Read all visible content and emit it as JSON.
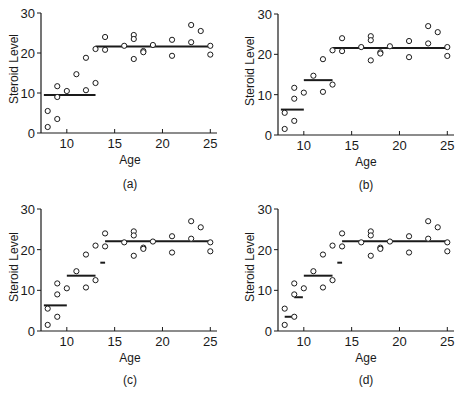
{
  "chart_data": [
    {
      "type": "scatter",
      "panel_label": "(a)",
      "xlabel": "Age",
      "ylabel": "Steroid Level",
      "xlim": [
        7.3,
        25.7
      ],
      "ylim": [
        0,
        30
      ],
      "xticks": [
        10,
        15,
        20,
        25
      ],
      "yticks": [
        0,
        10,
        20,
        30
      ],
      "grid": false,
      "points": [
        [
          8,
          1.5
        ],
        [
          8,
          5.5
        ],
        [
          9,
          3.5
        ],
        [
          9,
          9
        ],
        [
          9,
          11.7
        ],
        [
          10,
          10.5
        ],
        [
          11,
          14.7
        ],
        [
          12,
          10.7
        ],
        [
          12,
          18.8
        ],
        [
          13,
          12.5
        ],
        [
          13,
          21
        ],
        [
          14,
          24
        ],
        [
          14,
          20.8
        ],
        [
          16,
          21.8
        ],
        [
          17,
          24.5
        ],
        [
          17,
          23.5
        ],
        [
          17,
          18.5
        ],
        [
          18,
          20.5
        ],
        [
          18,
          20.2
        ],
        [
          19,
          22
        ],
        [
          21,
          23.3
        ],
        [
          21,
          19.3
        ],
        [
          23,
          27
        ],
        [
          23,
          22.7
        ],
        [
          24,
          25.5
        ],
        [
          25,
          21.8
        ],
        [
          25,
          19.6
        ]
      ],
      "step_fit": [
        {
          "x0": 7.6,
          "x1": 13,
          "y": 9.5
        },
        {
          "x0": 13,
          "x1": 25,
          "y": 21.6
        }
      ]
    },
    {
      "type": "scatter",
      "panel_label": "(b)",
      "xlabel": "Age",
      "ylabel": "Steroid Level",
      "xlim": [
        7.3,
        25.7
      ],
      "ylim": [
        0,
        30
      ],
      "xticks": [
        10,
        15,
        20,
        25
      ],
      "yticks": [
        0,
        10,
        20,
        30
      ],
      "grid": false,
      "points": [
        [
          8,
          1.5
        ],
        [
          8,
          5.5
        ],
        [
          9,
          3.5
        ],
        [
          9,
          9
        ],
        [
          9,
          11.7
        ],
        [
          10,
          10.5
        ],
        [
          11,
          14.7
        ],
        [
          12,
          10.7
        ],
        [
          12,
          18.8
        ],
        [
          13,
          12.5
        ],
        [
          13,
          21
        ],
        [
          14,
          24
        ],
        [
          14,
          20.8
        ],
        [
          16,
          21.8
        ],
        [
          17,
          24.5
        ],
        [
          17,
          23.5
        ],
        [
          17,
          18.5
        ],
        [
          18,
          20.5
        ],
        [
          18,
          20.2
        ],
        [
          19,
          22
        ],
        [
          21,
          23.3
        ],
        [
          21,
          19.3
        ],
        [
          23,
          27
        ],
        [
          23,
          22.7
        ],
        [
          24,
          25.5
        ],
        [
          25,
          21.8
        ],
        [
          25,
          19.6
        ]
      ],
      "step_fit": [
        {
          "x0": 7.6,
          "x1": 10,
          "y": 6.3
        },
        {
          "x0": 10,
          "x1": 13,
          "y": 13.6
        },
        {
          "x0": 13,
          "x1": 25,
          "y": 21.6
        }
      ]
    },
    {
      "type": "scatter",
      "panel_label": "(c)",
      "xlabel": "Age",
      "ylabel": "Steroid Level",
      "xlim": [
        7.3,
        25.7
      ],
      "ylim": [
        0,
        30
      ],
      "xticks": [
        10,
        15,
        20,
        25
      ],
      "yticks": [
        0,
        10,
        20,
        30
      ],
      "grid": false,
      "points": [
        [
          8,
          1.5
        ],
        [
          8,
          5.5
        ],
        [
          9,
          3.5
        ],
        [
          9,
          9
        ],
        [
          9,
          11.7
        ],
        [
          10,
          10.5
        ],
        [
          11,
          14.7
        ],
        [
          12,
          10.7
        ],
        [
          12,
          18.8
        ],
        [
          13,
          12.5
        ],
        [
          13,
          21
        ],
        [
          14,
          24
        ],
        [
          14,
          20.8
        ],
        [
          16,
          21.8
        ],
        [
          17,
          24.5
        ],
        [
          17,
          23.5
        ],
        [
          17,
          18.5
        ],
        [
          18,
          20.5
        ],
        [
          18,
          20.2
        ],
        [
          19,
          22
        ],
        [
          21,
          23.3
        ],
        [
          21,
          19.3
        ],
        [
          23,
          27
        ],
        [
          23,
          22.7
        ],
        [
          24,
          25.5
        ],
        [
          25,
          21.8
        ],
        [
          25,
          19.6
        ]
      ],
      "step_fit": [
        {
          "x0": 7.6,
          "x1": 10,
          "y": 6.3
        },
        {
          "x0": 10,
          "x1": 13,
          "y": 13.6
        },
        {
          "x0": 13.5,
          "x1": 14,
          "y": 16.8
        },
        {
          "x0": 14,
          "x1": 25,
          "y": 22.1
        }
      ]
    },
    {
      "type": "scatter",
      "panel_label": "(d)",
      "xlabel": "Age",
      "ylabel": "Steroid Level",
      "xlim": [
        7.3,
        25.7
      ],
      "ylim": [
        0,
        30
      ],
      "xticks": [
        10,
        15,
        20,
        25
      ],
      "yticks": [
        0,
        10,
        20,
        30
      ],
      "grid": false,
      "points": [
        [
          8,
          1.5
        ],
        [
          8,
          5.5
        ],
        [
          9,
          3.5
        ],
        [
          9,
          9
        ],
        [
          9,
          11.7
        ],
        [
          10,
          10.5
        ],
        [
          11,
          14.7
        ],
        [
          12,
          10.7
        ],
        [
          12,
          18.8
        ],
        [
          13,
          12.5
        ],
        [
          13,
          21
        ],
        [
          14,
          24
        ],
        [
          14,
          20.8
        ],
        [
          16,
          21.8
        ],
        [
          17,
          24.5
        ],
        [
          17,
          23.5
        ],
        [
          17,
          18.5
        ],
        [
          18,
          20.5
        ],
        [
          18,
          20.2
        ],
        [
          19,
          22
        ],
        [
          21,
          23.3
        ],
        [
          21,
          19.3
        ],
        [
          23,
          27
        ],
        [
          23,
          22.7
        ],
        [
          24,
          25.5
        ],
        [
          25,
          21.8
        ],
        [
          25,
          19.6
        ]
      ],
      "step_fit": [
        {
          "x0": 8,
          "x1": 9,
          "y": 3.5
        },
        {
          "x0": 9,
          "x1": 9.9,
          "y": 8.3
        },
        {
          "x0": 10,
          "x1": 13,
          "y": 13.6
        },
        {
          "x0": 13.5,
          "x1": 14,
          "y": 16.8
        },
        {
          "x0": 14,
          "x1": 25,
          "y": 22.1
        }
      ]
    }
  ],
  "panels": [
    {
      "label": "(a)",
      "xlabel": "Age",
      "ylabel": "Steroid Level"
    },
    {
      "label": "(b)",
      "xlabel": "Age",
      "ylabel": "Steroid Level"
    },
    {
      "label": "(c)",
      "xlabel": "Age",
      "ylabel": "Steroid Level"
    },
    {
      "label": "(d)",
      "xlabel": "Age",
      "ylabel": "Steroid Level"
    }
  ],
  "style": {
    "ink": "#1a1a1a",
    "background": "#ffffff"
  }
}
